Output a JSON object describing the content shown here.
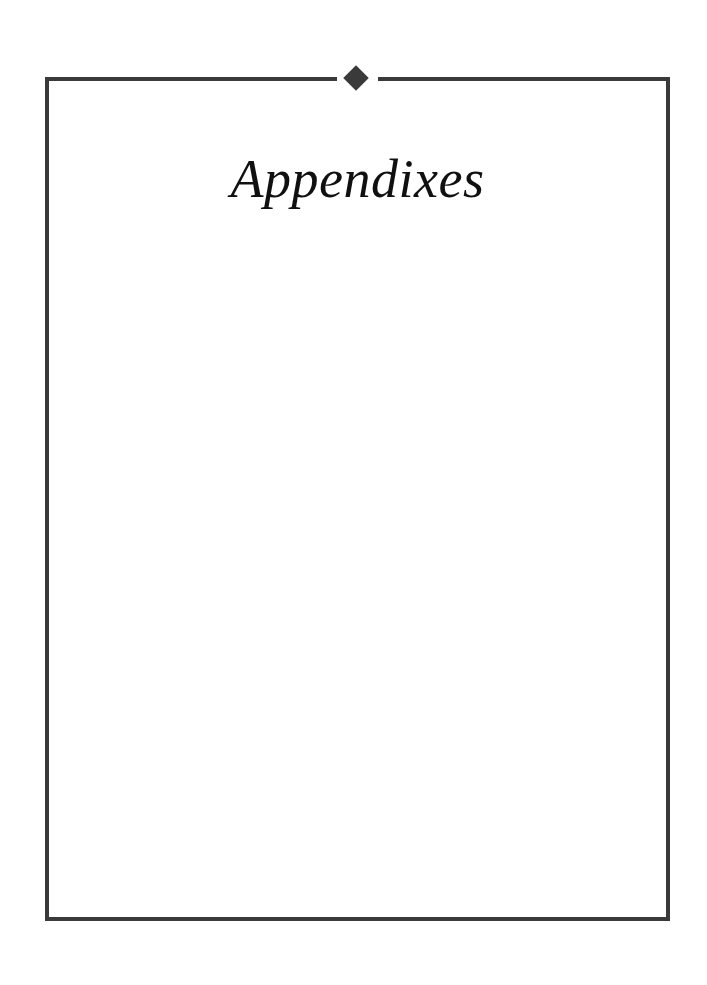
{
  "page": {
    "kind": "part-title-page",
    "background_color": "#ffffff",
    "title": "Appendixes",
    "body_text": ""
  },
  "frame": {
    "name": "rule-frame",
    "color": "#3a3a3a",
    "thickness_px": 4,
    "left_px": 45,
    "top_px": 77,
    "width_px": 625,
    "height_px": 844
  },
  "ornament": {
    "icon": "diamond-icon",
    "shape": "diamond",
    "color": "#3a3a3a",
    "size_px": 24,
    "center_x_px": 356,
    "center_y_px": 78
  },
  "rules": {
    "top_left_segment_label": "top-rule-left",
    "top_right_segment_label": "top-rule-right",
    "left_label": "left-rule",
    "right_label": "right-rule",
    "bottom_label": "bottom-rule"
  }
}
